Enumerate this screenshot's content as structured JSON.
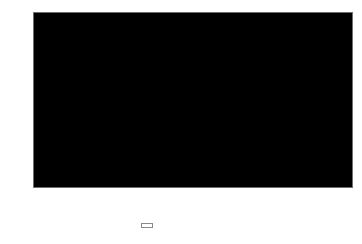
{
  "chart_data": {
    "type": "area",
    "stacked": true,
    "title": "",
    "xlabel": "",
    "ylabel": "%",
    "categories": [
      "1993",
      "1994",
      "1995",
      "1996",
      "1997",
      "1998",
      "1999",
      "2000",
      "2001",
      "2002",
      "2003",
      "2004",
      "2005",
      "2006",
      "2007"
    ],
    "series": [
      {
        "name": "SOEs",
        "color": "#c9c9c9",
        "values": [
          73,
          73,
          73,
          73,
          73,
          71.5,
          70.5,
          69.5,
          68.5,
          65.5,
          63.5,
          61,
          58,
          56,
          54
        ]
      },
      {
        "name": "Others",
        "color": "#5a5a5a",
        "values": [
          27,
          27,
          27,
          27,
          27,
          28.5,
          29.5,
          30.5,
          31.5,
          34.5,
          36.5,
          39,
          42,
          44,
          46
        ]
      }
    ],
    "ylim": [
      0,
      100
    ],
    "y_ticks": [
      0,
      10,
      20,
      30,
      40,
      50,
      60,
      70,
      80,
      90,
      100
    ],
    "y_tick_labels": [
      "0",
      "10",
      "20",
      "30",
      "40",
      "50",
      "60",
      "70",
      "80",
      "90",
      "100"
    ],
    "grid": false,
    "legend_position": "bottom-center"
  },
  "axes": {
    "y_title": "%"
  },
  "legend": {
    "entries": [
      {
        "label": "Others",
        "color": "#5a5a5a"
      },
      {
        "label": "SOEs",
        "color": "#c9c9c9"
      }
    ]
  }
}
